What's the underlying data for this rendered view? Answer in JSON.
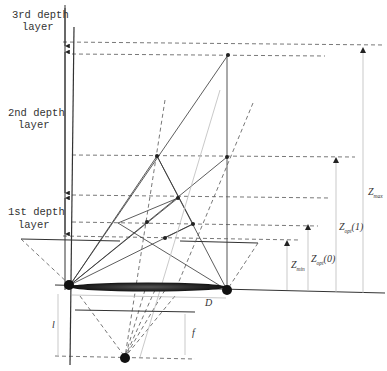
{
  "diagram": {
    "layers": [
      {
        "line1": "3rd depth",
        "line2": "layer"
      },
      {
        "line1": "2nd depth",
        "line2": "layer"
      },
      {
        "line1": "1st depth",
        "line2": "layer"
      }
    ],
    "labels": {
      "D": "D",
      "f": "f",
      "l": "l",
      "z_min": "Z",
      "z_min_sub": "min",
      "z_opt0": "Z",
      "z_opt0_sub": "opt",
      "z_opt0_arg": "(0)",
      "z_opt1": "Z",
      "z_opt1_sub": "opt",
      "z_opt1_arg": "(1)",
      "z_max": "Z",
      "z_max_sub": "max"
    },
    "colors": {
      "line": "#333333",
      "dashed": "#555555",
      "lens": "#222222",
      "faint": "#bbbbbb"
    }
  }
}
